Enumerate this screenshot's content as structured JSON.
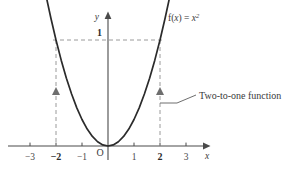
{
  "figure": {
    "background_color": "#ffffff",
    "curve_color": "#2b2b2b",
    "axis_color": "#4a4a4a",
    "dash_color": "#9a9a9a"
  },
  "axes": {
    "x_axis_name": "x",
    "y_axis_name": "y",
    "origin_label": "O",
    "x_ticks": [
      {
        "label": "−3",
        "value": -3,
        "bold": false
      },
      {
        "label": "−2",
        "value": -2,
        "bold": true
      },
      {
        "label": "−1",
        "value": -1,
        "bold": false
      },
      {
        "label": "1",
        "value": 1,
        "bold": false
      },
      {
        "label": "2",
        "value": 2,
        "bold": true
      },
      {
        "label": "3",
        "value": 3,
        "bold": false
      }
    ],
    "y_ticks": [
      {
        "label": "1",
        "value": 1,
        "bold": true
      }
    ],
    "xlim": [
      -3.6,
      3.9
    ],
    "ylim": [
      -0.22,
      1.45
    ]
  },
  "function_label": {
    "prefix": "f(",
    "arg": "x",
    "middle": ") = ",
    "base": "x",
    "exponent": "2"
  },
  "annotation": {
    "text": "Two-to-one function"
  },
  "guides": {
    "horizontal_dash_y": 1,
    "vertical_dash_x": [
      -2,
      2
    ],
    "arrow_marker": "up-triangle",
    "arrow_count": 2
  },
  "chart_data": {
    "type": "line",
    "title": "",
    "xlabel": "x",
    "ylabel": "y",
    "xlim": [
      -3.6,
      3.9
    ],
    "ylim": [
      -0.22,
      1.45
    ],
    "grid": false,
    "legend": "none",
    "series": [
      {
        "name": "f(x) = x^2",
        "equation": "y = x^2",
        "scale_note": "curve drawn so that x = ±2 maps to the labelled y value 1",
        "x": [
          -2.35,
          -2.2,
          -2.0,
          -1.8,
          -1.6,
          -1.4,
          -1.2,
          -1.0,
          -0.8,
          -0.6,
          -0.4,
          -0.2,
          0,
          0.2,
          0.4,
          0.6,
          0.8,
          1.0,
          1.2,
          1.4,
          1.6,
          1.8,
          2.0,
          2.2,
          2.35
        ],
        "y": [
          1.38,
          1.21,
          1.0,
          0.81,
          0.64,
          0.49,
          0.36,
          0.25,
          0.16,
          0.09,
          0.04,
          0.01,
          0,
          0.01,
          0.04,
          0.09,
          0.16,
          0.25,
          0.36,
          0.49,
          0.64,
          0.81,
          1.0,
          1.21,
          1.38
        ]
      }
    ],
    "annotations": [
      {
        "text": "f(x) = x²",
        "x": 2.45,
        "y": 1.4
      },
      {
        "text": "Two-to-one function",
        "x": 2.6,
        "y": 0.55
      },
      {
        "text": "1",
        "x": -0.18,
        "y": 1.08
      },
      {
        "text": "O",
        "x": -0.18,
        "y": -0.1
      }
    ],
    "reference_lines": [
      {
        "orientation": "horizontal",
        "value": 1,
        "style": "dashed",
        "from": -2,
        "to": 2
      },
      {
        "orientation": "vertical",
        "value": -2,
        "style": "dashed",
        "from": 0,
        "to": 1
      },
      {
        "orientation": "vertical",
        "value": 2,
        "style": "dashed",
        "from": 0,
        "to": 1
      }
    ]
  }
}
